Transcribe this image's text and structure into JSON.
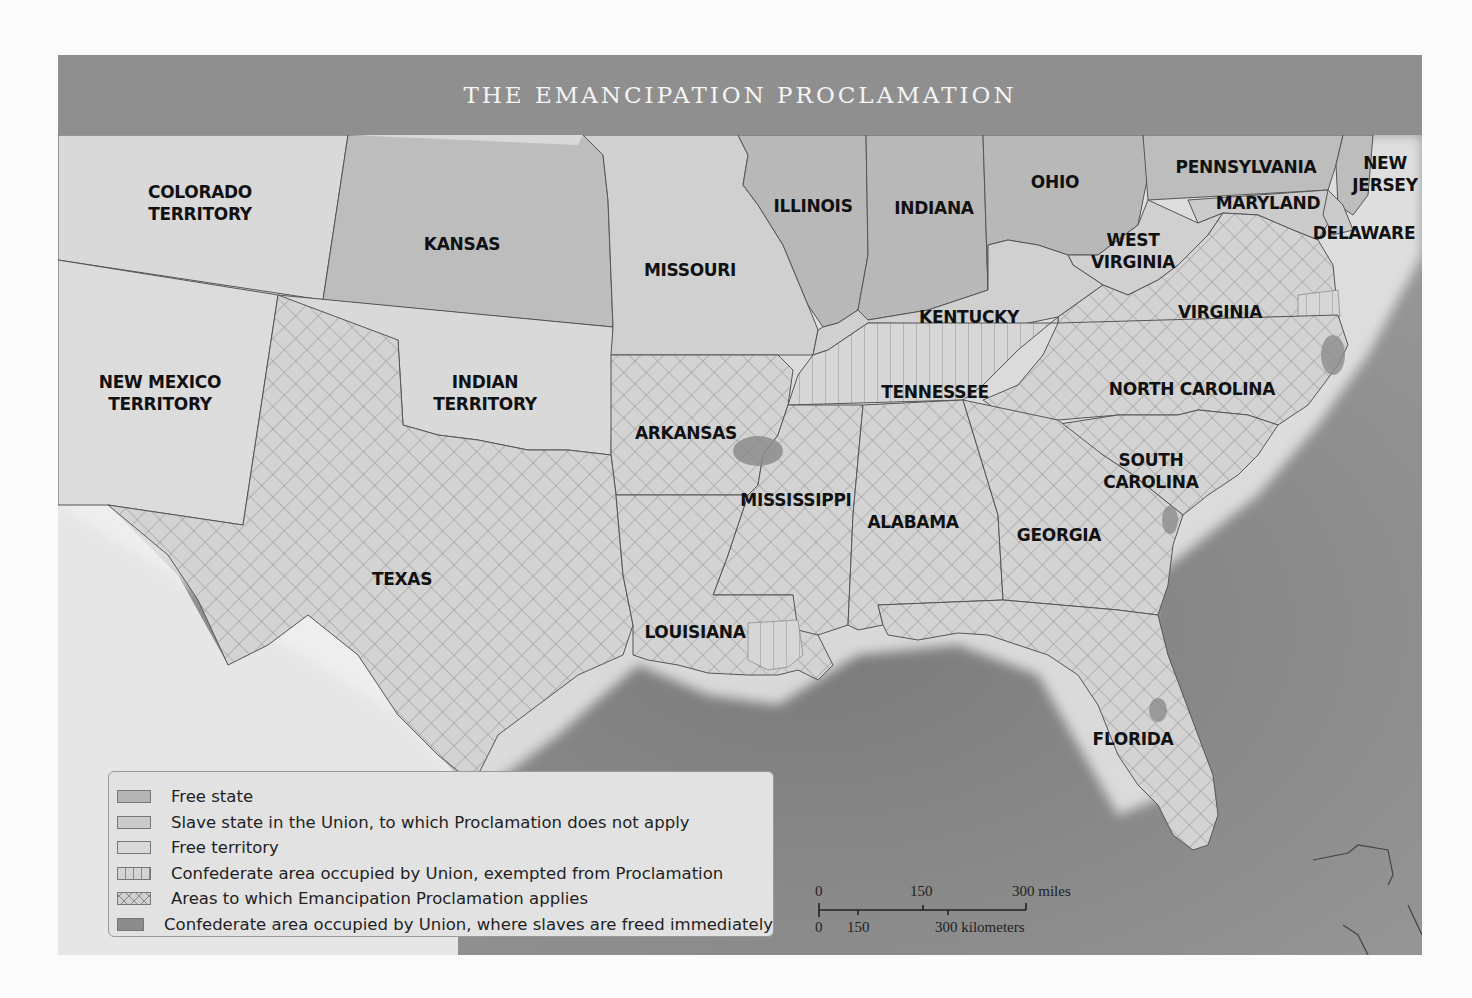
{
  "header": {
    "title": "THE EMANCIPATION PROCLAMATION"
  },
  "colors": {
    "header_band": "#8f8f8f",
    "free_state": "#b5b5b5",
    "slave_state_union": "#cacaca",
    "free_territory": "#d9d9d9",
    "confederate_exempted": "#d4d4d4",
    "proclamation_applies": "#d0d0d0",
    "freed_immediately": "#8c8c8c",
    "water": "#8e8e8e",
    "foreign_land": "#e9e9e9"
  },
  "states": [
    {
      "name": "colorado-territory",
      "label": "COLORADO\nTERRITORY",
      "x": 142,
      "y": 148,
      "category": "Free territory"
    },
    {
      "name": "kansas",
      "label": "KANSAS",
      "x": 404,
      "y": 189,
      "category": "Free state"
    },
    {
      "name": "new-mexico-territory",
      "label": "NEW MEXICO\nTERRITORY",
      "x": 102,
      "y": 338,
      "category": "Free territory"
    },
    {
      "name": "indian-territory",
      "label": "INDIAN\nTERRITORY",
      "x": 427,
      "y": 338,
      "category": "Free territory"
    },
    {
      "name": "missouri",
      "label": "MISSOURI",
      "x": 632,
      "y": 215,
      "category": "Slave state in the Union"
    },
    {
      "name": "illinois",
      "label": "ILLINOIS",
      "x": 755,
      "y": 151,
      "category": "Free state"
    },
    {
      "name": "indiana",
      "label": "INDIANA",
      "x": 876,
      "y": 153,
      "category": "Free state"
    },
    {
      "name": "ohio",
      "label": "OHIO",
      "x": 997,
      "y": 127,
      "category": "Free state"
    },
    {
      "name": "pennsylvania",
      "label": "PENNSYLVANIA",
      "x": 1188,
      "y": 112,
      "category": "Free state"
    },
    {
      "name": "new-jersey",
      "label": "NEW\nJERSEY",
      "x": 1327,
      "y": 119,
      "category": "Free state"
    },
    {
      "name": "maryland",
      "label": "MARYLAND",
      "x": 1210,
      "y": 148,
      "category": "Slave state in the Union"
    },
    {
      "name": "delaware",
      "label": "DELAWARE",
      "x": 1306,
      "y": 178,
      "category": "Slave state in the Union"
    },
    {
      "name": "west-virginia",
      "label": "WEST\nVIRGINIA",
      "x": 1075,
      "y": 196,
      "category": "Slave state in the Union"
    },
    {
      "name": "kentucky",
      "label": "KENTUCKY",
      "x": 911,
      "y": 262,
      "category": "Slave state in the Union"
    },
    {
      "name": "virginia",
      "label": "VIRGINIA",
      "x": 1162,
      "y": 257,
      "category": "Areas to which Emancipation Proclamation applies"
    },
    {
      "name": "tennessee",
      "label": "TENNESSEE",
      "x": 877,
      "y": 337,
      "category": "Confederate area occupied by Union, exempted from Proclamation"
    },
    {
      "name": "north-carolina",
      "label": "NORTH CAROLINA",
      "x": 1134,
      "y": 334,
      "category": "Areas to which Emancipation Proclamation applies"
    },
    {
      "name": "arkansas",
      "label": "ARKANSAS",
      "x": 628,
      "y": 378,
      "category": "Areas to which Emancipation Proclamation applies"
    },
    {
      "name": "south-carolina",
      "label": "SOUTH\nCAROLINA",
      "x": 1093,
      "y": 416,
      "category": "Areas to which Emancipation Proclamation applies"
    },
    {
      "name": "mississippi",
      "label": "MISSISSIPPI",
      "x": 738,
      "y": 445,
      "category": "Areas to which Emancipation Proclamation applies"
    },
    {
      "name": "alabama",
      "label": "ALABAMA",
      "x": 855,
      "y": 467,
      "category": "Areas to which Emancipation Proclamation applies"
    },
    {
      "name": "georgia",
      "label": "GEORGIA",
      "x": 1001,
      "y": 480,
      "category": "Areas to which Emancipation Proclamation applies"
    },
    {
      "name": "texas",
      "label": "TEXAS",
      "x": 344,
      "y": 524,
      "category": "Areas to which Emancipation Proclamation applies"
    },
    {
      "name": "louisiana",
      "label": "LOUISIANA",
      "x": 637,
      "y": 577,
      "category": "Areas to which Emancipation Proclamation applies"
    },
    {
      "name": "florida",
      "label": "FLORIDA",
      "x": 1075,
      "y": 684,
      "category": "Areas to which Emancipation Proclamation applies"
    }
  ],
  "legend": {
    "items": [
      {
        "label": "Free state",
        "pattern": "free_state"
      },
      {
        "label": "Slave state in the Union, to which Proclamation does not apply",
        "pattern": "slave_state_union"
      },
      {
        "label": "Free territory",
        "pattern": "free_territory"
      },
      {
        "label": "Confederate area occupied by Union, exempted from Proclamation",
        "pattern": "confederate_exempted"
      },
      {
        "label": "Areas to which Emancipation Proclamation applies",
        "pattern": "proclamation_applies"
      },
      {
        "label": "Confederate area occupied by Union, where slaves are freed immediately",
        "pattern": "freed_immediately"
      }
    ]
  },
  "scale": {
    "miles": {
      "ticks": [
        "0",
        "150",
        "300 miles"
      ]
    },
    "kilometers": {
      "ticks": [
        "0",
        "150",
        "300 kilometers"
      ]
    }
  }
}
